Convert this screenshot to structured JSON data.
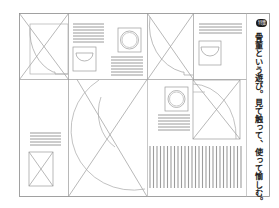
{
  "page": {
    "type": "layout-wireframe-illustration",
    "background": "#ffffff",
    "line_color": "#9a9a9a"
  },
  "sidebar_caption": {
    "badge": "特集",
    "text": "骨董という遊び。見て触って、使って愉しむ。"
  },
  "placeholders": {
    "image_box_icon": "x-cross-placeholder",
    "bowl_icon": "bowl-semicircle",
    "plate_icon": "round-plate",
    "text_lines_icon": "horizontal-text-lines",
    "barcode_block_icon": "vertical-stripes"
  }
}
